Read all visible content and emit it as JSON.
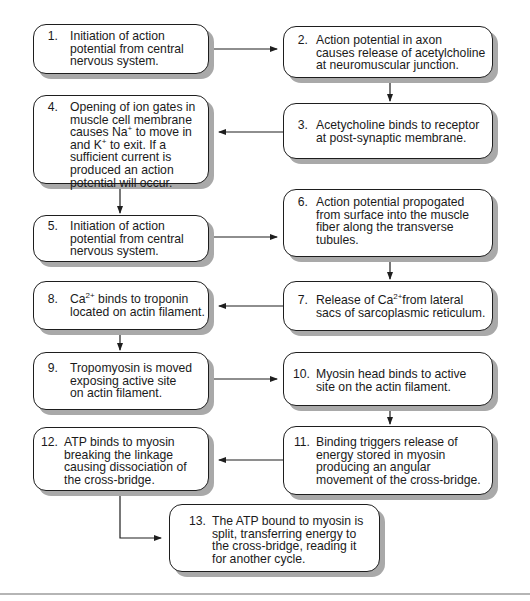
{
  "diagram": {
    "type": "flowchart",
    "steps": [
      {
        "id": 1,
        "num": "1.",
        "text": "Initiation of action\npotential from central\nnervous system."
      },
      {
        "id": 2,
        "num": "2.",
        "text": "Action potential in axon\ncauses release of acetylcholine\nat neuromuscular junction."
      },
      {
        "id": 3,
        "num": "3.",
        "text": "Acetycholine binds to receptor\nat post-synaptic membrane."
      },
      {
        "id": 4,
        "num": "4.",
        "text_parts": [
          "Opening of ion gates in\nmuscle cell membrane\ncauses Na",
          "+",
          " to move in\nand K",
          "+",
          " to exit. If a\nsufficient current is\nproduced an action\npotential will occur."
        ]
      },
      {
        "id": 5,
        "num": "5.",
        "text": "Initiation of action\npotential from central\nnervous system."
      },
      {
        "id": 6,
        "num": "6.",
        "text": "Action potential propogated\nfrom surface into the muscle\nfiber along the transverse\ntubules."
      },
      {
        "id": 7,
        "num": "7.",
        "text_parts": [
          "Release of Ca",
          "2+",
          "from lateral\nsacs of sarcoplasmic reticulum."
        ]
      },
      {
        "id": 8,
        "num": "8.",
        "text_parts": [
          "Ca",
          "2+",
          " binds to troponin\nlocated on actin filament."
        ]
      },
      {
        "id": 9,
        "num": "9.",
        "text": "Tropomyosin is moved\nexposing active site\non actin filament."
      },
      {
        "id": 10,
        "num": "10.",
        "text": "Myosin head binds to active\nsite on the actin filament."
      },
      {
        "id": 11,
        "num": "11.",
        "text": "Binding triggers release of\nenergy stored in myosin\nproducing an angular\nmovement of the cross-bridge."
      },
      {
        "id": 12,
        "num": "12.",
        "text": "ATP binds to myosin\nbreaking the linkage\ncausing dissociation of\nthe cross-bridge."
      },
      {
        "id": 13,
        "num": "13.",
        "text": "The ATP bound to myosin is\nsplit, transferring energy to\nthe cross-bridge, reading it\nfor another cycle."
      }
    ],
    "flow": [
      {
        "from": 1,
        "to": 2,
        "direction": "right"
      },
      {
        "from": 2,
        "to": 3,
        "direction": "down"
      },
      {
        "from": 3,
        "to": 4,
        "direction": "left"
      },
      {
        "from": 4,
        "to": 5,
        "direction": "down"
      },
      {
        "from": 5,
        "to": 6,
        "direction": "right"
      },
      {
        "from": 6,
        "to": 7,
        "direction": "down"
      },
      {
        "from": 7,
        "to": 8,
        "direction": "left"
      },
      {
        "from": 8,
        "to": 9,
        "direction": "down"
      },
      {
        "from": 9,
        "to": 10,
        "direction": "right"
      },
      {
        "from": 10,
        "to": 11,
        "direction": "down"
      },
      {
        "from": 11,
        "to": 12,
        "direction": "left"
      },
      {
        "from": 12,
        "to": 13,
        "direction": "down-then-right"
      }
    ],
    "colors": {
      "box_border": "#1e1e1e",
      "box_fill": "#ffffff",
      "box_shadow": "#a9a9a9",
      "connector": "#1e1e1e",
      "bottom_rule": "#b5b5b5"
    }
  }
}
